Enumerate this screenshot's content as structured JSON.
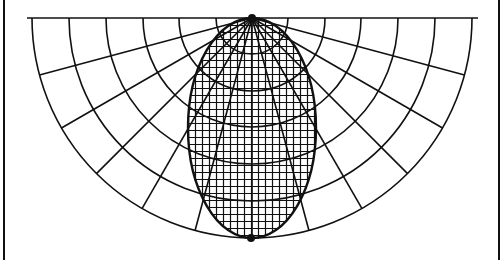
{
  "diagram": {
    "title": "Polar grid with elliptical fine grid",
    "canvas": {
      "width": 504,
      "height": 260,
      "background": "#ffffff"
    },
    "stroke_color": "#111111",
    "frame": {
      "left_x": 4,
      "right_x": 499
    },
    "baseline": {
      "y": 18,
      "x1": 27,
      "x2": 478
    },
    "polar_grid": {
      "center": [
        252,
        18
      ],
      "radii": [
        36,
        73,
        109,
        146,
        183,
        220
      ],
      "angle_step_deg": 15,
      "angle_start_deg": 0,
      "angle_end_deg": 180
    },
    "ellipse": {
      "center": [
        252,
        128
      ],
      "rx": 64,
      "ry": 110,
      "fine_grid_spacing": 7
    },
    "points": [
      {
        "name": "top-pole",
        "x": 252,
        "y": 18,
        "r": 4
      },
      {
        "name": "bottom-pole",
        "x": 251,
        "y": 238,
        "r": 4
      }
    ]
  }
}
